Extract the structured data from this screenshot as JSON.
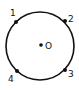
{
  "diagram": {
    "type": "circle-with-points",
    "circle": {
      "cx": 40,
      "cy": 46,
      "r": 34,
      "stroke": "#111111"
    },
    "center": {
      "x": 41,
      "y": 45,
      "label": "O"
    },
    "points": [
      {
        "label": "1",
        "x": 16,
        "y": 22,
        "lx": 10,
        "ly": 16
      },
      {
        "label": "2",
        "x": 65,
        "y": 21,
        "lx": 69,
        "ly": 23
      },
      {
        "label": "3",
        "x": 65,
        "y": 70,
        "lx": 69,
        "ly": 77
      },
      {
        "label": "4",
        "x": 17,
        "y": 71,
        "lx": 8,
        "ly": 82
      }
    ]
  }
}
